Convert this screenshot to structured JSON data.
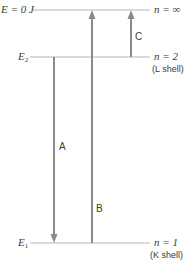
{
  "diagram": {
    "levels": [
      {
        "id": "infinity",
        "left_label": "E = 0 J",
        "right_label": "n = ∞",
        "shell": "",
        "y": 10
      },
      {
        "id": "L",
        "left_label_main": "E",
        "left_label_sub": "2",
        "right_label": "n = 2",
        "shell": "(L shell)",
        "y": 57
      },
      {
        "id": "K",
        "left_label_main": "E",
        "left_label_sub": "1",
        "right_label": "n = 1",
        "shell": "(K shell)",
        "y": 243
      }
    ],
    "transitions": [
      {
        "label": "A",
        "from": "n = 2",
        "to": "n = 1",
        "direction": "down"
      },
      {
        "label": "B",
        "from": "n = 1",
        "to": "n = ∞",
        "direction": "up"
      },
      {
        "label": "C",
        "from": "n = 2",
        "to": "n = ∞",
        "direction": "up"
      }
    ],
    "colors": {
      "level_line": "#b0b0b0",
      "arrow": "#8a8a8a",
      "text": "#3a3a3a"
    }
  }
}
